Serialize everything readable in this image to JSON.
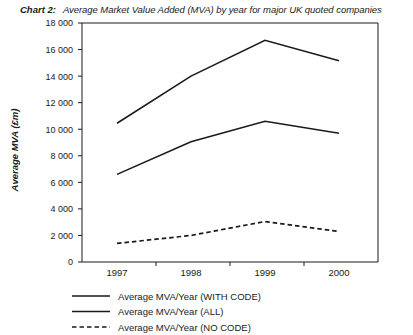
{
  "header": {
    "chart_label": "Chart 2:",
    "chart_title": "Average Market Value Added (MVA) by year for major UK quoted companies"
  },
  "axes": {
    "y_title": "Average MVA (£m)",
    "y_ticks": [
      "18 000",
      "16 000",
      "14 000",
      "12 000",
      "10 000",
      "8 000",
      "6 000",
      "4 000",
      "2 000",
      "0"
    ],
    "x_ticks": [
      "1997",
      "1998",
      "1999",
      "2000"
    ]
  },
  "legend": {
    "items": [
      {
        "label": "Average MVA/Year (WITH CODE)",
        "style": "solid"
      },
      {
        "label": "Average MVA/Year (ALL)",
        "style": "solid"
      },
      {
        "label": "Average MVA/Year (NO CODE)",
        "style": "dashed"
      }
    ]
  },
  "colors": {
    "line": "#1a1a1a",
    "axis": "#1a1a1a",
    "background": "#ffffff"
  },
  "chart_data": {
    "type": "line",
    "title": "Average Market Value Added (MVA) by year for major UK quoted companies",
    "xlabel": "",
    "ylabel": "Average MVA (£m)",
    "categories": [
      "1997",
      "1998",
      "1999",
      "2000"
    ],
    "ylim": [
      0,
      18000
    ],
    "ytick_step": 2000,
    "grid": false,
    "legend_position": "bottom-left",
    "series": [
      {
        "name": "Average MVA/Year (WITH CODE)",
        "style": "solid",
        "values": [
          10450,
          14000,
          16700,
          15150
        ]
      },
      {
        "name": "Average MVA/Year (ALL)",
        "style": "solid",
        "values": [
          6600,
          9050,
          10600,
          9700
        ]
      },
      {
        "name": "Average MVA/Year (NO CODE)",
        "style": "dashed",
        "values": [
          1400,
          2000,
          3050,
          2300
        ]
      }
    ]
  }
}
